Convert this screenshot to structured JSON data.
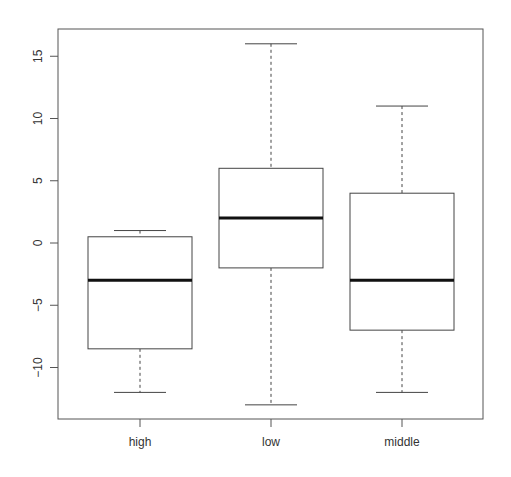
{
  "chart_data": {
    "type": "boxplot",
    "title": "",
    "xlabel": "",
    "ylabel": "",
    "categories": [
      "high",
      "low",
      "middle"
    ],
    "boxes": [
      {
        "name": "high",
        "whisker_low": -12,
        "q1": -8.5,
        "median": -3,
        "q3": 0.5,
        "whisker_high": 1
      },
      {
        "name": "low",
        "whisker_low": -13,
        "q1": -2,
        "median": 2,
        "q3": 6,
        "whisker_high": 16
      },
      {
        "name": "middle",
        "whisker_low": -12,
        "q1": -7,
        "median": -3,
        "q3": 4,
        "whisker_high": 11
      }
    ],
    "y_ticks": [
      -10,
      -5,
      0,
      5,
      10,
      15
    ],
    "y_tick_labels": [
      "-10",
      "-5",
      "0",
      "5",
      "10",
      "15"
    ],
    "ylim": [
      -14.1,
      17.2
    ],
    "grid": false,
    "legend": null
  },
  "colors": {
    "axis": "#555555",
    "box": "#444444",
    "median": "#111111"
  }
}
